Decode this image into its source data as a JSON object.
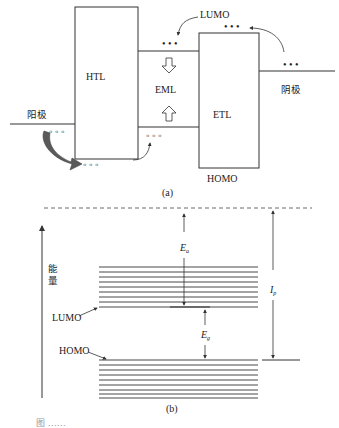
{
  "panel_a": {
    "label": "(a)",
    "htl_label": "HTL",
    "eml_label": "EML",
    "etl_label": "ETL",
    "lumo_label": "LUMO",
    "homo_label": "HOMO",
    "anode_label": "阳极",
    "cathode_label": "阴极",
    "dots": "• • •",
    "hole_dots": "◦ ◦ ◦"
  },
  "panel_b": {
    "label": "(b)",
    "energy_axis_label_line1": "能",
    "energy_axis_label_line2": "量",
    "lumo_label": "LUMO",
    "homo_label": "HOMO",
    "ea_symbol": "E",
    "ea_sub": "a",
    "eg_symbol": "E",
    "eg_sub": "g",
    "ip_symbol": "I",
    "ip_sub": "p",
    "lumo_band_lines": 9,
    "homo_band_lines": 9
  },
  "colors": {
    "line": "#333333",
    "arrow_dark": "#555555",
    "caption": "#9a9a9a"
  },
  "caption": "图 ……"
}
